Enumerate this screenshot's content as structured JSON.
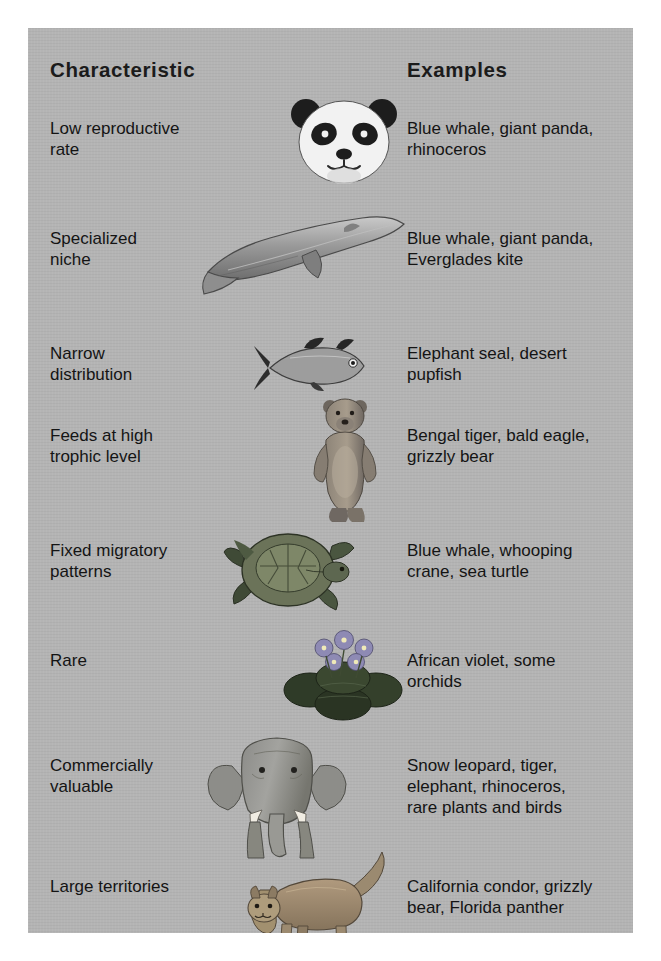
{
  "figure": {
    "panel_background": "#b4b4b4",
    "text_color": "#141414",
    "headers": {
      "characteristic": "Characteristic",
      "examples": "Examples"
    },
    "rows": [
      {
        "characteristic_lines": [
          "Low reproductive",
          "rate"
        ],
        "examples_lines": [
          "Blue whale, giant panda,",
          "rhinoceros"
        ],
        "illustration": "giant-panda-head-illustration"
      },
      {
        "characteristic_lines": [
          "Specialized",
          "niche"
        ],
        "examples_lines": [
          "Blue whale, giant panda,",
          "Everglades kite"
        ],
        "illustration": "blue-whale-illustration"
      },
      {
        "characteristic_lines": [
          "Narrow",
          "distribution"
        ],
        "examples_lines": [
          "Elephant seal, desert",
          "pupfish"
        ],
        "illustration": "desert-pupfish-illustration"
      },
      {
        "characteristic_lines": [
          "Feeds at high",
          "trophic level"
        ],
        "examples_lines": [
          "Bengal tiger, bald eagle,",
          "grizzly bear"
        ],
        "illustration": "grizzly-bear-illustration"
      },
      {
        "characteristic_lines": [
          "Fixed migratory",
          "patterns"
        ],
        "examples_lines": [
          "Blue whale, whooping",
          "crane, sea turtle"
        ],
        "illustration": "sea-turtle-illustration"
      },
      {
        "characteristic_lines": [
          "Rare"
        ],
        "examples_lines": [
          "African violet, some",
          "orchids"
        ],
        "illustration": "african-violet-illustration"
      },
      {
        "characteristic_lines": [
          "Commercially",
          "valuable"
        ],
        "examples_lines": [
          "Snow leopard, tiger,",
          "elephant, rhinoceros,",
          "rare plants and birds"
        ],
        "illustration": "elephant-illustration"
      },
      {
        "characteristic_lines": [
          "Large territories"
        ],
        "examples_lines": [
          "California condor, grizzly",
          "bear, Florida panther"
        ],
        "illustration": "florida-panther-illustration"
      }
    ]
  }
}
